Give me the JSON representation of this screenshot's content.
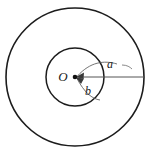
{
  "figure": {
    "type": "geometry-diagram",
    "canvas": {
      "width": 146,
      "height": 157,
      "background": "#ffffff"
    },
    "labels": {
      "center": "O",
      "outer_radius": "a",
      "inner_radius": "b"
    },
    "colors": {
      "stroke": "#1c1c1c",
      "leader": "#5a5a5a",
      "dot": "#111111",
      "background": "#ffffff"
    },
    "geometry": {
      "center": {
        "x": 75,
        "y": 77
      },
      "outer_circle": {
        "cx": 75,
        "cy": 77,
        "r": 69
      },
      "inner_circle": {
        "cx": 75,
        "cy": 77,
        "r": 29
      },
      "radius_line": {
        "x1": 75,
        "y1": 77,
        "x2": 144,
        "y2": 77
      },
      "label_positions": {
        "center": {
          "x": 63,
          "y": 77
        },
        "outer_radius": {
          "x": 110,
          "y": 65
        },
        "inner_radius": {
          "x": 88,
          "y": 91
        }
      }
    }
  }
}
